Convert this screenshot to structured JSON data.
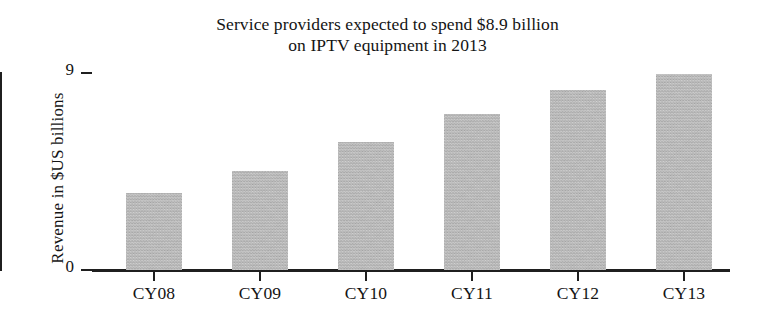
{
  "chart_data": {
    "type": "bar",
    "title": "Service providers expected to spend $8.9 billion on IPTV equipment in 2013",
    "title_lines": [
      "Service providers expected to spend $8.9 billion",
      "on IPTV equipment in 2013"
    ],
    "xlabel": "",
    "ylabel": "Revenue in $US billions",
    "categories": [
      "CY08",
      "CY09",
      "CY10",
      "CY11",
      "CY12",
      "CY13"
    ],
    "values": [
      3.5,
      4.5,
      5.8,
      7.1,
      8.2,
      8.9
    ],
    "ylim": [
      0,
      9
    ],
    "ytick_labels": [
      "0",
      "9"
    ],
    "ytick_values": [
      0,
      9
    ],
    "grid": false,
    "legend": false,
    "bar_color": "#b6b6b6",
    "axis_color": "#1f1f1f",
    "text_color": "#141414",
    "background_color": "#ffffff"
  }
}
